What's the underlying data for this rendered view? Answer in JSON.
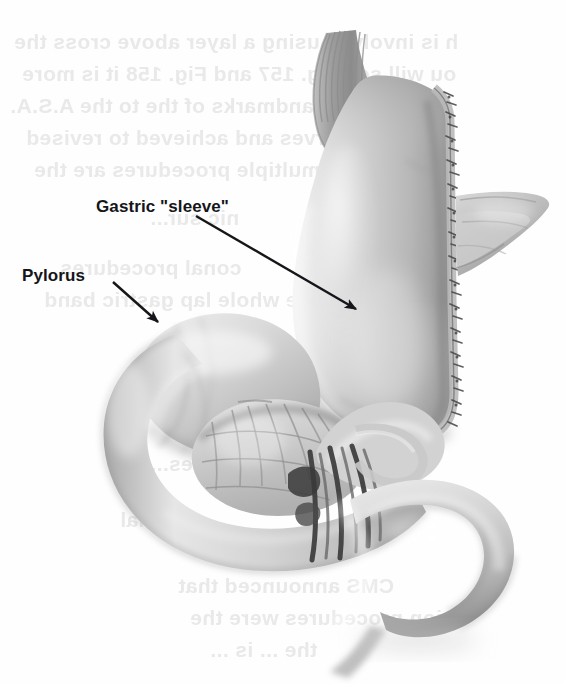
{
  "figure": {
    "kind": "medical-illustration",
    "background_color": "#fefefe",
    "ink_color": "#15161a",
    "tissue_light": "#e8e8e8",
    "tissue_mid": "#bdbdbd",
    "tissue_dark": "#6e6e6e",
    "shadow": "#555555"
  },
  "labels": {
    "gastric_sleeve": "Gastric \"sleeve\"",
    "pylorus": "Pylorus"
  },
  "annotations": [
    {
      "name": "gastric-sleeve-leader",
      "label": "Gastric \"sleeve\"",
      "arrow_from": [
        196,
        216
      ],
      "arrow_to": [
        356,
        309
      ]
    },
    {
      "name": "pylorus-leader",
      "label": "Pylorus",
      "arrow_from": [
        113,
        282
      ],
      "arrow_to": [
        158,
        322
      ]
    }
  ],
  "anatomy_parts": [
    {
      "name": "esophagus",
      "label": "esophagus"
    },
    {
      "name": "gastric-sleeve",
      "label": "gastric sleeve (tubularized stomach)"
    },
    {
      "name": "staple-line",
      "label": "staple line along greater curvature"
    },
    {
      "name": "tissue-flap",
      "label": "resected tissue flap / omental edge"
    },
    {
      "name": "antrum",
      "label": "gastric antrum"
    },
    {
      "name": "pylorus",
      "label": "pylorus"
    },
    {
      "name": "duodenum",
      "label": "duodenal C-loop"
    },
    {
      "name": "mesentery",
      "label": "mesentery with vessels"
    },
    {
      "name": "jejunum",
      "label": "proximal jejunum loop"
    }
  ],
  "bleed_through_lines": [
    "h is involved using a layer above cross the",
    "ou will see Fig. 157 and Fig. 158 it is more",
    "the usual landmarks of the to the A.S.A.",
    "the nerves and achieved to revised",
    "ifying multiple procedures are the",
    "nic sur...",
    "conal procedures",
    "the whole lap gastric band",
    "ou sees...",
    "ional",
    "CMS announced that",
    "ion procedures were the",
    "the ... is ..."
  ]
}
